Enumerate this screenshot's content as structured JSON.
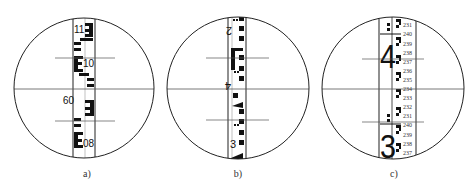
{
  "figure": {
    "panels": [
      {
        "caption": "a)",
        "staff_type": "E-pattern staff",
        "numbers": [
          "11",
          "10",
          "09",
          "08"
        ]
      },
      {
        "caption": "b)",
        "staff_type": "inverted block staff",
        "numbers": [
          "2",
          "4",
          "3"
        ]
      },
      {
        "caption": "c)",
        "staff_type": "double-scale staff",
        "main_numbers": [
          "4",
          "3"
        ],
        "scale_labels": [
          "231",
          "240",
          "239",
          "238",
          "237",
          "236",
          "235",
          "234",
          "233",
          "232",
          "231",
          "240",
          "239",
          "238",
          "237"
        ]
      }
    ],
    "colors": {
      "line": "#222222",
      "reticle": "#555555",
      "ink": "#111111"
    }
  }
}
